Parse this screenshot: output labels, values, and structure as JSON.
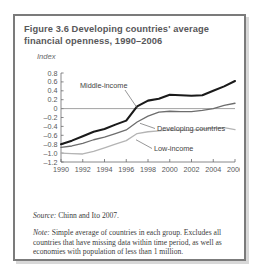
{
  "figure": {
    "title": "Figure 3.6  Developing countries' average financial openness, 1990–2006",
    "axis_unit_label": "Index",
    "source": "Source:",
    "source_text": " Chinn and Ito 2007.",
    "note": "Note:",
    "note_text": " Simple average of countries in each group. Excludes all countries that have missing data within time period, as well as economies with population of less than 1 million."
  },
  "chart_data": {
    "type": "line",
    "title": "Figure 3.6  Developing countries' average financial openness, 1990–2006",
    "xlabel": "",
    "ylabel": "Index",
    "xlim": [
      1990,
      2006
    ],
    "ylim": [
      -1.2,
      0.8
    ],
    "yticks": [
      "0.8",
      "0.6",
      "0.4",
      "0.2",
      "0",
      "–0.2",
      "–0.4",
      "–0.6",
      "–0.8",
      "–1.0",
      "–1.2"
    ],
    "ytick_values": [
      0.8,
      0.6,
      0.4,
      0.2,
      0,
      -0.2,
      -0.4,
      -0.6,
      -0.8,
      -1.0,
      -1.2
    ],
    "xticks": [
      "1990",
      "1992",
      "1994",
      "1996",
      "1998",
      "2000",
      "2002",
      "2004",
      "2006"
    ],
    "x": [
      1990,
      1991,
      1992,
      1993,
      1994,
      1995,
      1996,
      1997,
      1998,
      1999,
      2000,
      2001,
      2002,
      2003,
      2004,
      2005,
      2006
    ],
    "grid": false,
    "zero_line": true,
    "legend_position": "inline-annotations",
    "series": [
      {
        "name": "Middle-income",
        "color": "#1a1a1a",
        "width": 2.1,
        "values": [
          -0.8,
          -0.72,
          -0.62,
          -0.52,
          -0.46,
          -0.36,
          -0.27,
          0.05,
          0.18,
          0.22,
          0.31,
          0.3,
          0.29,
          0.3,
          0.4,
          0.5,
          0.62
        ]
      },
      {
        "name": "Developing countries",
        "color": "#6d6d6d",
        "width": 1.3,
        "values": [
          -0.87,
          -0.84,
          -0.78,
          -0.7,
          -0.64,
          -0.56,
          -0.48,
          -0.3,
          -0.17,
          -0.08,
          -0.06,
          -0.07,
          -0.07,
          -0.04,
          0.0,
          0.07,
          0.12
        ]
      },
      {
        "name": "Low-income",
        "color": "#b4b4b4",
        "width": 1.3,
        "values": [
          -1.0,
          -1.01,
          -1.02,
          -0.96,
          -0.88,
          -0.8,
          -0.72,
          -0.56,
          -0.52,
          -0.5,
          -0.48,
          -0.49,
          -0.49,
          -0.46,
          -0.44,
          -0.43,
          -0.47
        ]
      }
    ],
    "annotations": [
      {
        "label": "Middle-income",
        "series": "Middle-income"
      },
      {
        "label": "Developing countries",
        "series": "Developing countries"
      },
      {
        "label": "Low-income",
        "series": "Low-income"
      }
    ]
  }
}
